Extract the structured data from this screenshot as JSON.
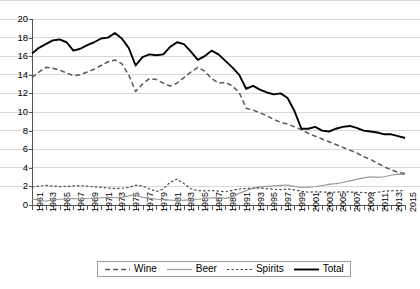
{
  "chart_data": {
    "type": "line",
    "title": "",
    "subtitle": "",
    "xlabel": "",
    "ylabel": "",
    "xlim": [
      1961,
      2015
    ],
    "ylim": [
      0,
      20
    ],
    "ytick_step": 2,
    "xtick_label_step": 2,
    "grid": true,
    "legend_position": "bottom",
    "yticks": [
      "0",
      "2",
      "4",
      "6",
      "8",
      "10",
      "12",
      "14",
      "16",
      "18",
      "20"
    ],
    "x": [
      1961,
      1962,
      1963,
      1964,
      1965,
      1966,
      1967,
      1968,
      1969,
      1970,
      1971,
      1972,
      1973,
      1974,
      1975,
      1976,
      1977,
      1978,
      1979,
      1980,
      1981,
      1982,
      1983,
      1984,
      1985,
      1986,
      1987,
      1988,
      1989,
      1990,
      1991,
      1992,
      1993,
      1994,
      1995,
      1996,
      1997,
      1998,
      1999,
      2000,
      2001,
      2002,
      2003,
      2004,
      2005,
      2006,
      2007,
      2008,
      2009,
      2010,
      2011,
      2012,
      2013,
      2014,
      2015
    ],
    "xtick_labels": [
      "1961",
      "1963",
      "1965",
      "1967",
      "1969",
      "1971",
      "1973",
      "1975",
      "1977",
      "1979",
      "1981",
      "1983",
      "1985",
      "1987",
      "1989",
      "1991",
      "1993",
      "1995",
      "1997",
      "1999",
      "2001",
      "2003",
      "2005",
      "2007",
      "2009",
      "2011",
      "2013"
    ],
    "series": [
      {
        "name": "Wine",
        "style": "dashed",
        "color": "#595959",
        "values": [
          13.7,
          14.3,
          14.8,
          14.7,
          14.5,
          14.2,
          13.9,
          14.0,
          14.3,
          14.6,
          15.0,
          15.4,
          15.6,
          15.2,
          14.0,
          12.2,
          13.0,
          13.6,
          13.5,
          13.1,
          12.8,
          13.1,
          13.7,
          14.3,
          14.8,
          14.4,
          13.6,
          13.1,
          13.2,
          12.8,
          12.1,
          10.4,
          10.2,
          9.9,
          9.6,
          9.2,
          8.9,
          8.7,
          8.4,
          8.1,
          7.7,
          7.4,
          7.1,
          6.8,
          6.5,
          6.2,
          5.9,
          5.6,
          5.2,
          4.9,
          4.5,
          4.1,
          3.8,
          3.5,
          3.4
        ]
      },
      {
        "name": "Beer",
        "style": "solid-light",
        "color": "#9a9a9a",
        "values": [
          0.62,
          0.58,
          0.4,
          0.55,
          0.62,
          0.66,
          0.68,
          0.67,
          0.7,
          0.74,
          0.78,
          0.82,
          0.78,
          0.82,
          0.98,
          1.12,
          0.82,
          0.75,
          0.62,
          0.58,
          0.52,
          0.5,
          0.52,
          0.56,
          0.62,
          0.7,
          0.76,
          0.8,
          0.72,
          0.9,
          1.25,
          1.55,
          1.8,
          1.95,
          2.0,
          2.05,
          2.12,
          2.15,
          2.0,
          1.88,
          1.92,
          1.96,
          2.1,
          2.22,
          2.3,
          2.42,
          2.6,
          2.76,
          2.92,
          3.02,
          2.96,
          3.04,
          3.2,
          3.32,
          3.3
        ]
      },
      {
        "name": "Spirits",
        "style": "dotted",
        "color": "#4d4d4d",
        "values": [
          1.95,
          2.02,
          2.1,
          2.05,
          1.98,
          2.0,
          2.05,
          2.08,
          2.02,
          1.95,
          1.9,
          1.82,
          1.78,
          1.8,
          1.88,
          2.12,
          2.05,
          1.72,
          1.45,
          1.72,
          2.45,
          2.78,
          2.3,
          1.75,
          1.55,
          1.52,
          1.55,
          1.5,
          1.42,
          1.58,
          1.72,
          1.78,
          1.8,
          1.82,
          1.76,
          1.7,
          1.66,
          1.72,
          1.62,
          1.48,
          1.38,
          1.42,
          1.4,
          1.36,
          1.38,
          1.42,
          1.4,
          1.36,
          1.34,
          1.3,
          1.36,
          1.48,
          1.52,
          1.55,
          1.52
        ]
      },
      {
        "name": "Total",
        "style": "solid-bold",
        "color": "#000000",
        "values": [
          16.3,
          16.9,
          17.3,
          17.7,
          17.8,
          17.5,
          16.6,
          16.8,
          17.2,
          17.5,
          17.9,
          18.0,
          18.5,
          17.9,
          16.9,
          15.0,
          15.9,
          16.2,
          16.1,
          16.2,
          17.0,
          17.5,
          17.3,
          16.5,
          15.6,
          16.0,
          16.6,
          16.2,
          15.5,
          14.8,
          14.0,
          12.5,
          12.8,
          12.4,
          12.1,
          11.9,
          12.0,
          11.5,
          10.1,
          8.2,
          8.2,
          8.4,
          8.0,
          7.9,
          8.2,
          8.4,
          8.5,
          8.3,
          8.0,
          7.9,
          7.8,
          7.6,
          7.6,
          7.4,
          7.2
        ]
      }
    ]
  },
  "legend": {
    "items": [
      {
        "label": "Wine",
        "key": "dashed-line-key"
      },
      {
        "label": "Beer",
        "key": "solid-light-line-key"
      },
      {
        "label": "Spirits",
        "key": "dotted-line-key"
      },
      {
        "label": "Total",
        "key": "solid-bold-line-key"
      }
    ]
  }
}
